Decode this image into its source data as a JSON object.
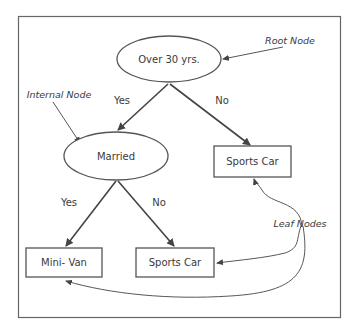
{
  "diagram": {
    "type": "decision-tree",
    "nodes": {
      "root": {
        "label": "Over 30 yrs.",
        "shape": "ellipse"
      },
      "internal": {
        "label": "Married",
        "shape": "ellipse"
      },
      "leaf_right": {
        "label": "Sports Car",
        "shape": "rect"
      },
      "leaf_minivan": {
        "label": "Mini- Van",
        "shape": "rect"
      },
      "leaf_sports_bottom": {
        "label": "Sports Car",
        "shape": "rect"
      }
    },
    "edges": {
      "root_yes": "Yes",
      "root_no": "No",
      "married_yes": "Yes",
      "married_no": "No"
    },
    "annotations": {
      "root": "Root Node",
      "internal": "Internal Node",
      "leaf": "Leaf Nodes"
    },
    "colors": {
      "stroke": "#555555",
      "text": "#3a3a3a",
      "background": "#ffffff"
    }
  }
}
